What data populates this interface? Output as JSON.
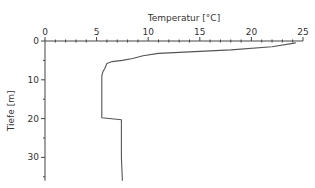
{
  "chart_data": {
    "type": "line",
    "title": "",
    "xlabel": "Temperatur [°C]",
    "ylabel": "Tiefe [m]",
    "xlim": [
      0,
      25
    ],
    "ylim": [
      36,
      0
    ],
    "x_ticks": [
      0,
      5,
      10,
      15,
      20,
      25
    ],
    "y_ticks": [
      0,
      10,
      20,
      30
    ],
    "x_axis_position": "top",
    "y_inverted": true,
    "grid": false,
    "series": [
      {
        "name": "Temperaturprofil",
        "points": [
          [
            24.3,
            0.5
          ],
          [
            22.0,
            1.5
          ],
          [
            18.0,
            2.3
          ],
          [
            14.0,
            2.8
          ],
          [
            11.0,
            3.2
          ],
          [
            9.5,
            3.8
          ],
          [
            8.5,
            4.5
          ],
          [
            7.5,
            5.0
          ],
          [
            6.5,
            5.3
          ],
          [
            6.0,
            5.8
          ],
          [
            5.8,
            7.0
          ],
          [
            5.6,
            8.0
          ],
          [
            5.5,
            9.0
          ],
          [
            5.5,
            15.0
          ],
          [
            5.5,
            19.8
          ],
          [
            7.4,
            20.3
          ],
          [
            7.4,
            25.0
          ],
          [
            7.4,
            30.0
          ],
          [
            7.5,
            36.0
          ]
        ]
      }
    ]
  }
}
